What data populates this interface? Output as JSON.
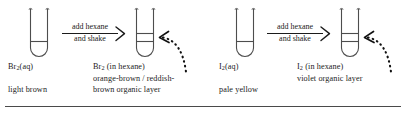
{
  "figure": {
    "background_color": "#ffffff",
    "ink_color": "#1b1b1b"
  },
  "panels": [
    {
      "id": "bromine",
      "before": {
        "tube_name": "bromine-aqueous-tube",
        "formula": "Br",
        "subscript": "2",
        "formula_suffix": "(aq)",
        "colour_description": "light brown",
        "layers": 1
      },
      "arrow": {
        "line_1": "add hexane",
        "line_2": "and shake"
      },
      "after": {
        "tube_name": "bromine-hexane-tube",
        "formula": "Br",
        "subscript": "2",
        "formula_suffix": " (in hexane)",
        "colour_line_1": "orange-brown / reddish-",
        "colour_line_2": "brown organic layer",
        "layers": 2
      },
      "callout": {
        "name": "organic-layer-pointer",
        "style": "dotted-curved-arrow"
      }
    },
    {
      "id": "iodine",
      "before": {
        "tube_name": "iodine-aqueous-tube",
        "formula": "I",
        "subscript": "2",
        "formula_suffix": "(aq)",
        "colour_description": "pale yellow",
        "layers": 1
      },
      "arrow": {
        "line_1": "add hexane",
        "line_2": "and shake"
      },
      "after": {
        "tube_name": "iodine-hexane-tube",
        "formula": "I",
        "subscript": "2",
        "formula_suffix": " (in hexane)",
        "colour_line_1": "violet organic layer",
        "colour_line_2": "",
        "layers": 2
      },
      "callout": {
        "name": "organic-layer-pointer",
        "style": "dotted-curved-arrow"
      }
    }
  ],
  "footer": {
    "rule_present": true
  }
}
